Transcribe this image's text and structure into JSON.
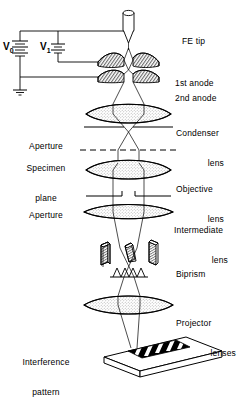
{
  "figure": {
    "type": "schematic-diagram",
    "background_color": "#ffffff",
    "line_color": "#000000",
    "fill_color": "#d8d8d8"
  },
  "circuit": {
    "v0_label": "V",
    "v0_sub": "0",
    "v1_label": "V",
    "v1_sub": "1",
    "ground_name": "ground-symbol"
  },
  "labels_right": [
    {
      "id": "fe-tip",
      "line1": "FE tip",
      "line2": ""
    },
    {
      "id": "first-anode",
      "line1": "1st anode",
      "line2": ""
    },
    {
      "id": "second-anode",
      "line1": "2nd anode",
      "line2": ""
    },
    {
      "id": "condenser-lens",
      "line1": "Condenser",
      "line2": "lens"
    },
    {
      "id": "objective-lens",
      "line1": "Objective",
      "line2": "lens"
    },
    {
      "id": "intermediate-lens",
      "line1": "Intermediate",
      "line2": "lens"
    },
    {
      "id": "biprism",
      "line1": "Biprism",
      "line2": ""
    },
    {
      "id": "projector-lenses",
      "line1": "Projector",
      "line2": "lenses"
    }
  ],
  "labels_left": [
    {
      "id": "aperture-upper",
      "line1": "Aperture",
      "line2": ""
    },
    {
      "id": "specimen-plane",
      "line1": "Specimen",
      "line2": "plane"
    },
    {
      "id": "aperture-lower",
      "line1": "Aperture",
      "line2": ""
    },
    {
      "id": "interference-pattern",
      "line1": "Interference",
      "line2": "pattern"
    }
  ],
  "components": {
    "fe_tip": "field-emission-tip",
    "anode_1": "first-anode-electrode",
    "anode_2": "second-anode-electrode",
    "condenser": "condenser-lens-element",
    "specimen": "specimen-plane-dashed-line",
    "objective": "objective-lens-element",
    "intermediate": "intermediate-lens-element",
    "biprism_slabs": 3,
    "wave_peaks": 4,
    "projector": "projector-lens-element",
    "detector": "interference-pattern-plate",
    "fringe_count": 6
  }
}
